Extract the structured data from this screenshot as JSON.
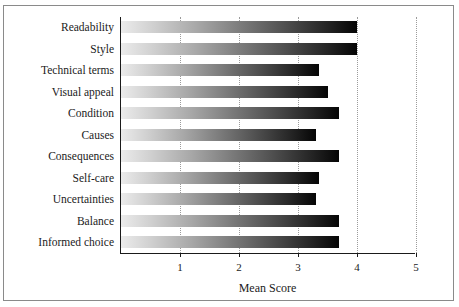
{
  "chart_data": {
    "type": "bar",
    "orientation": "horizontal",
    "title": "",
    "xlabel": "Mean Score",
    "ylabel": "",
    "xlim": [
      0,
      5
    ],
    "xticks": [
      1,
      2,
      3,
      4,
      5
    ],
    "xtick_labels": [
      "1",
      "2",
      "3",
      "4",
      "5"
    ],
    "grid": "vertical-dotted",
    "legend": "none",
    "categories": [
      "Readability",
      "Style",
      "Technical terms",
      "Visual appeal",
      "Condition",
      "Causes",
      "Consequences",
      "Self-care",
      "Uncertainties",
      "Balance",
      "Informed choice"
    ],
    "values": [
      4.0,
      4.0,
      3.35,
      3.5,
      3.7,
      3.3,
      3.7,
      3.35,
      3.3,
      3.7,
      3.7
    ],
    "bar_style": {
      "fill": "gradient",
      "gradient_from": "#ebebeb",
      "gradient_to": "#050505",
      "edge_color": "#000000"
    },
    "frame_color": "#8a8a8a",
    "axis_color": "#1a1a1a",
    "gridline_color": "#9b9b9b"
  }
}
